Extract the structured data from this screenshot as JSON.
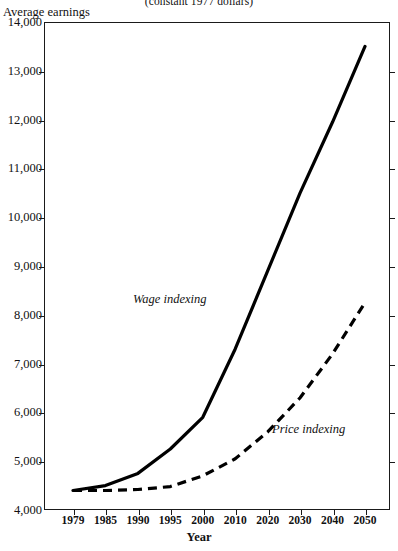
{
  "subtitle": "(constant 1977 dollars)",
  "y_axis_title": "Average earnings",
  "x_axis_title": "Year",
  "series_labels": {
    "wage": "Wage indexing",
    "price": "Price indexing"
  },
  "colors": {
    "axis": "#1a1a1a",
    "wage_line": "#000000",
    "price_line": "#000000",
    "background": "#ffffff"
  },
  "y_tick_labels": [
    "14,000",
    "13,000",
    "12,000",
    "11,000",
    "10,000",
    "9,000",
    "8,000",
    "7,000",
    "6,000",
    "5,000",
    "4,000"
  ],
  "x_tick_labels": [
    "1979",
    "1985",
    "1990",
    "1995",
    "2000",
    "2010",
    "2020",
    "2030",
    "2040",
    "2050"
  ],
  "chart_data": {
    "type": "line",
    "title": "",
    "subtitle": "(constant 1977 dollars)",
    "xlabel": "Year",
    "ylabel": "Average earnings",
    "ylim": [
      4000,
      14000
    ],
    "ytick_step": 1000,
    "grid": false,
    "legend": "inline-annotations",
    "categories": [
      "1979",
      "1985",
      "1990",
      "1995",
      "2000",
      "2010",
      "2020",
      "2030",
      "2040",
      "2050"
    ],
    "series": [
      {
        "name": "Wage indexing",
        "style": "solid",
        "values": [
          4400,
          4500,
          4750,
          5250,
          5900,
          7300,
          8900,
          10500,
          11950,
          13500
        ]
      },
      {
        "name": "Price indexing",
        "style": "dashed",
        "values": [
          4400,
          4400,
          4420,
          4480,
          4700,
          5050,
          5600,
          6300,
          7200,
          8250
        ]
      }
    ]
  }
}
